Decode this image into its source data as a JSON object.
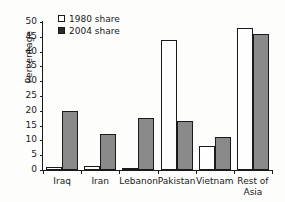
{
  "chart_data": {
    "type": "bar",
    "title": "",
    "xlabel": "",
    "ylabel": "Percentage",
    "ylim": [
      0,
      50
    ],
    "yticks": [
      0,
      5,
      10,
      15,
      20,
      25,
      30,
      35,
      40,
      45,
      50
    ],
    "grid": false,
    "legend_position": "top-left",
    "categories": [
      "Iraq",
      "Iran",
      "Lebanon",
      "Pakistan",
      "Vietnam",
      "Rest of Asia"
    ],
    "category_lines": [
      [
        "Iraq"
      ],
      [
        "Iran"
      ],
      [
        "Lebanon"
      ],
      [
        "Pakistan"
      ],
      [
        "Vietnam"
      ],
      [
        "Rest of",
        "Asia"
      ]
    ],
    "series": [
      {
        "name": "1980 share",
        "color": "#ffffff",
        "values": [
          1,
          1.5,
          0.3,
          44,
          8,
          48
        ]
      },
      {
        "name": "2004 share",
        "color": "#8a8a8a",
        "values": [
          20,
          12,
          17.5,
          16.5,
          11,
          46
        ]
      }
    ]
  },
  "legend": {
    "items": [
      {
        "label": "1980 share",
        "swatch": "open-square-icon"
      },
      {
        "label": "2004 share",
        "swatch": "filled-square-icon"
      }
    ]
  },
  "axis": {
    "y_title": "Percentage"
  }
}
